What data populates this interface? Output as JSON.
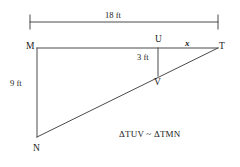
{
  "diagram": {
    "stroke_color": "#4a4a4a",
    "text_color": "#1a1a1a",
    "background_color": "#ffffff",
    "vertices": [
      {
        "name": "M",
        "label": "M",
        "x": 37,
        "y": 48
      },
      {
        "name": "U",
        "label": "U",
        "x": 158,
        "y": 48
      },
      {
        "name": "T",
        "label": "T",
        "x": 218,
        "y": 48
      },
      {
        "name": "V",
        "label": "V",
        "x": 158,
        "y": 75
      },
      {
        "name": "N",
        "label": "N",
        "x": 37,
        "y": 137
      }
    ],
    "dimension_line": {
      "label": "18 ft",
      "x_start": 30,
      "x_end": 218,
      "y": 22
    },
    "measures": [
      {
        "name": "height-MN",
        "label": "9 ft"
      },
      {
        "name": "height-UV",
        "label": "3 ft"
      },
      {
        "name": "segment-UT",
        "label": "x"
      }
    ],
    "similarity_statement": "ΔTUV ~ ΔTMN"
  }
}
